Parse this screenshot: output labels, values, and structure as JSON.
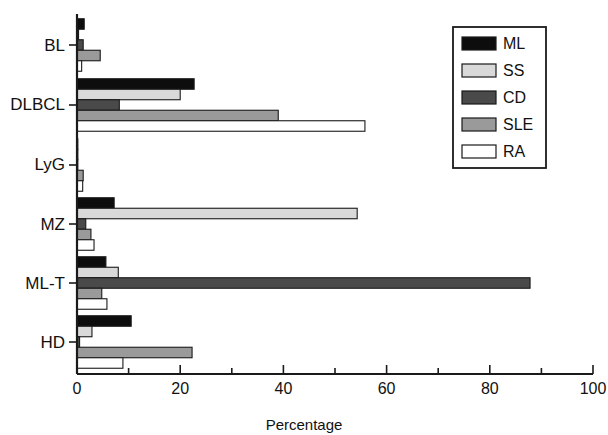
{
  "chart_data": {
    "type": "bar",
    "orientation": "horizontal",
    "title": "",
    "xlabel": "Percentage",
    "ylabel": "",
    "xlim": [
      0,
      100
    ],
    "xticks": [
      0,
      10,
      20,
      30,
      40,
      50,
      60,
      70,
      80,
      90,
      100
    ],
    "xtick_labels": [
      "0",
      "",
      "20",
      "",
      "40",
      "",
      "60",
      "",
      "80",
      "",
      "100"
    ],
    "grid": false,
    "legend_position": "top-right",
    "categories": [
      "BL",
      "DLBCL",
      "LyG",
      "MZ",
      "ML-T",
      "HD"
    ],
    "series": [
      {
        "name": "ML",
        "color": "#0d0d0d",
        "values": [
          1.4,
          22.7,
          0.0,
          7.2,
          5.6,
          10.5
        ]
      },
      {
        "name": "SS",
        "color": "#d9d9d9",
        "values": [
          0.3,
          20.0,
          0.0,
          54.3,
          8.0,
          2.9
        ]
      },
      {
        "name": "CD",
        "color": "#4a4a4a",
        "values": [
          1.2,
          8.2,
          0.0,
          1.7,
          87.8,
          0.5
        ]
      },
      {
        "name": "SLE",
        "color": "#9a9a9a",
        "values": [
          4.5,
          39.0,
          1.2,
          2.7,
          4.8,
          22.3
        ]
      },
      {
        "name": "RA",
        "color": "#ffffff",
        "values": [
          0.9,
          55.8,
          1.1,
          3.3,
          5.8,
          8.9
        ]
      }
    ]
  },
  "legend": {
    "entries": [
      {
        "label": "ML"
      },
      {
        "label": "SS"
      },
      {
        "label": "CD"
      },
      {
        "label": "SLE"
      },
      {
        "label": "RA"
      }
    ]
  },
  "axis": {
    "x_title": "Percentage"
  }
}
